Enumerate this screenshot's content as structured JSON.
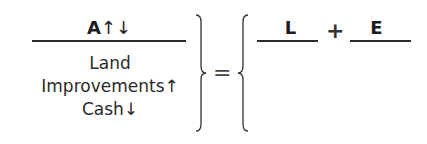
{
  "equation": {
    "assets": {
      "header_letter": "A",
      "header_arrows": "↑↓",
      "items": [
        {
          "label": "Land",
          "arrow": ""
        },
        {
          "label": "Improvements",
          "arrow": "↑"
        },
        {
          "label": "Cash",
          "arrow": "↓"
        }
      ]
    },
    "equals": "=",
    "liabilities": {
      "header_letter": "L"
    },
    "plus": "+",
    "equity": {
      "header_letter": "E"
    }
  },
  "colors": {
    "text": "#1c1c1c",
    "rule": "#2a2a2a",
    "background": "#ffffff"
  }
}
